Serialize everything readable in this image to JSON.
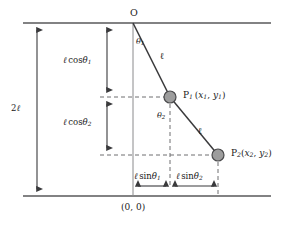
{
  "figure": {
    "type": "physics-schematic",
    "colors": {
      "line": "#58585a",
      "rod": "#3a3a3c",
      "bob_fill": "#9d9d9d",
      "bob_stroke": "#4a4a4c",
      "dashed": "#6e6e70",
      "text": "#1a1a1a",
      "background": "#ffffff"
    },
    "labels": {
      "pivot": "O",
      "total_length": "2ℓ",
      "cos_theta1": "ℓ cosθ₁",
      "cos_theta2": "ℓ cosθ₂",
      "sin_theta1": "ℓ sinθ₁",
      "sin_theta2": "ℓ sinθ₂",
      "rod1_length": "ℓ",
      "rod2_length": "ℓ",
      "angle1": "θ₁",
      "angle2": "θ₂",
      "point1": "P₁ (x₁, y₁)",
      "point2": "P₂(x₂, y₂)",
      "origin": "(0, 0)"
    },
    "label_parts": {
      "pivot": "O",
      "total_length_num": "2",
      "ell": "ℓ",
      "cos": "cos",
      "sin": "sin",
      "theta": "θ",
      "sub1": "1",
      "sub2": "2",
      "p": "P",
      "x": "x",
      "y": "y",
      "paren_open": "(",
      "paren_close": ")",
      "comma": ", ",
      "origin_text": "(0, 0)"
    },
    "geometry": {
      "pivot_x": 133,
      "pivot_y": 23,
      "bob1_x": 170,
      "bob1_y": 97,
      "bob2_x": 218,
      "bob2_y": 155,
      "bob_radius": 6,
      "top_rail_y": 23,
      "bottom_rail_y": 196,
      "rail_left": 23,
      "rail_right": 271,
      "dim_arrow_left_x": 37,
      "dim_arrow_cos_x": 107
    }
  }
}
